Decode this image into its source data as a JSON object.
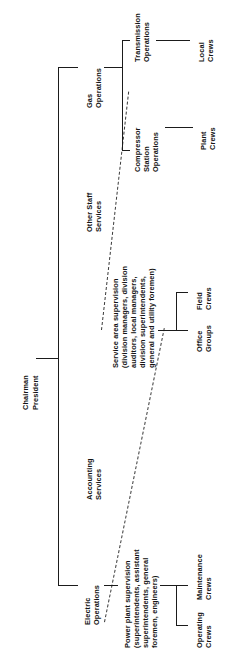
{
  "chart_data": {
    "type": "diagram",
    "orientation": "rotated-90-counterclockwise",
    "root": {
      "line1": "Chairman",
      "line2": "President"
    },
    "nodes": {
      "electric_operations": "Electric\nOperations",
      "accounting_services": "Accounting\nServices",
      "other_staff_services": "Other Staff\nServices",
      "gas_operations": "Gas\nOperations",
      "power_plant_supervision": "Power plant supervision\n(superintendents, assistant\nsuperintendents, general\nforemen, engineers)",
      "service_area_supervision": "Service area supervision\n(division managers, division\nauditors, local managers,\ndivision superintendents,\ngeneral and utility foremen)",
      "compressor_station_operations": "Compressor\nStation\nOperations",
      "transmission_operations": "Transmission\nOperations"
    },
    "leaves": {
      "operating_crews": "Operating\nCrews",
      "maintenance_crews": "Maintenance\nCrews",
      "office_groups": "Office\nGroups",
      "field_crews": "Field\nCrews",
      "plant_crews": "Plant\nCrews",
      "local_crews": "Local\nCrews"
    },
    "edges": [
      {
        "from": "root",
        "to": "electric_operations",
        "style": "solid"
      },
      {
        "from": "root",
        "to": "accounting_services",
        "style": "solid"
      },
      {
        "from": "root",
        "to": "other_staff_services",
        "style": "solid"
      },
      {
        "from": "root",
        "to": "gas_operations",
        "style": "solid"
      },
      {
        "from": "electric_operations",
        "to": "power_plant_supervision",
        "style": "solid"
      },
      {
        "from": "power_plant_supervision",
        "to": "operating_crews",
        "style": "solid"
      },
      {
        "from": "power_plant_supervision",
        "to": "maintenance_crews",
        "style": "solid"
      },
      {
        "from": "electric_operations",
        "to": "service_area_supervision",
        "style": "dashed"
      },
      {
        "from": "gas_operations",
        "to": "service_area_supervision",
        "style": "dashed"
      },
      {
        "from": "service_area_supervision",
        "to": "office_groups",
        "style": "solid"
      },
      {
        "from": "service_area_supervision",
        "to": "field_crews",
        "style": "solid"
      },
      {
        "from": "gas_operations",
        "to": "compressor_station_operations",
        "style": "solid"
      },
      {
        "from": "gas_operations",
        "to": "transmission_operations",
        "style": "solid"
      },
      {
        "from": "compressor_station_operations",
        "to": "plant_crews",
        "style": "solid"
      },
      {
        "from": "transmission_operations",
        "to": "local_crews",
        "style": "solid"
      }
    ],
    "colors": {
      "text": "#141414",
      "line": "#1b1b1b",
      "dashed_line": "#3a3a3a",
      "background": "#ffffff"
    }
  }
}
